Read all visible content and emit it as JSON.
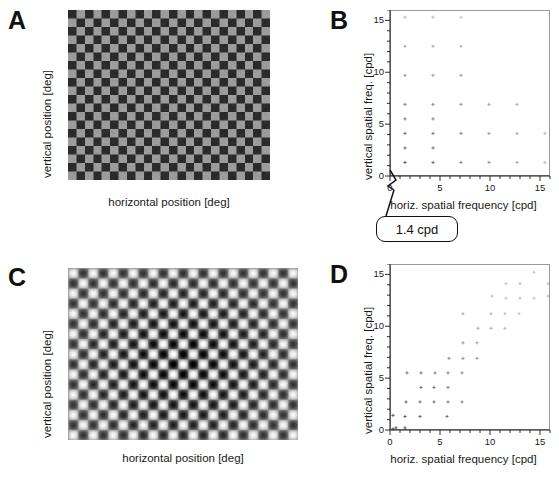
{
  "figure": {
    "panels": [
      {
        "id": "A",
        "letter": "A",
        "type": "stimulus",
        "stimulus": "checkerboard",
        "xlabel": "horizontal position [deg]",
        "ylabel": "vertical position [deg]"
      },
      {
        "id": "B",
        "letter": "B",
        "type": "scatter",
        "xlabel": "horiz. spatial frequency [cpd]",
        "ylabel": "vertical spatial freq. [cpd]"
      },
      {
        "id": "C",
        "letter": "C",
        "type": "stimulus",
        "stimulus": "blurred-checkerboard",
        "xlabel": "horizontal position [deg]",
        "ylabel": "vertical position [deg]"
      },
      {
        "id": "D",
        "letter": "D",
        "type": "scatter",
        "xlabel": "horiz. spatial frequency [cpd]",
        "ylabel": "vertical spatial freq. [cpd]"
      }
    ],
    "callout": {
      "text": "1.4 cpd"
    },
    "colors": {
      "ink": "#1a1a1a",
      "frame": "#9a9a9a",
      "point": "#555555",
      "checker_dark": "#2b2b2b",
      "checker_light": "#9a9a9a"
    }
  },
  "chart_data": [
    {
      "panel": "B",
      "type": "scatter",
      "title": "",
      "xlabel": "horiz. spatial frequency [cpd]",
      "ylabel": "vertical spatial freq. [cpd]",
      "xlim": [
        0,
        16
      ],
      "ylim": [
        0,
        16
      ],
      "xticks": [
        0,
        5,
        10,
        15
      ],
      "yticks": [
        0,
        5,
        10,
        15
      ],
      "minor_tick_step": 1,
      "grid": false,
      "legend": null,
      "annotation": "1.4 cpd",
      "annotation_target": [
        1.4,
        0
      ],
      "fundamental_cpd": 1.4,
      "description": "Regular lattice of odd-harmonic components of an ideal checkerboard; points at odd multiples of 1.4 cpd in both axes, amplitude falling off with frequency.",
      "x": [
        1.4,
        4.2,
        7.0,
        9.8,
        12.6,
        15.4,
        1.4,
        4.2,
        7.0,
        9.8,
        12.6,
        15.4,
        1.4,
        4.2,
        7.0,
        9.8,
        12.6,
        1.4,
        4.2,
        7.0,
        1.4,
        4.2,
        7.0,
        1.4,
        4.2,
        7.0,
        1.4,
        4.2,
        1.4,
        4.2
      ],
      "y": [
        1.4,
        1.4,
        1.4,
        1.4,
        1.4,
        1.4,
        4.2,
        4.2,
        4.2,
        4.2,
        4.2,
        4.2,
        7.0,
        7.0,
        7.0,
        7.0,
        7.0,
        9.8,
        9.8,
        9.8,
        12.6,
        12.6,
        12.6,
        15.4,
        15.4,
        15.4,
        2.8,
        2.8,
        5.6,
        5.6
      ]
    },
    {
      "panel": "D",
      "type": "scatter",
      "title": "",
      "xlabel": "horiz. spatial frequency [cpd]",
      "ylabel": "vertical spatial freq. [cpd]",
      "xlim": [
        0,
        16
      ],
      "ylim": [
        0,
        16
      ],
      "xticks": [
        0,
        5,
        10,
        15
      ],
      "yticks": [
        0,
        5,
        10,
        15
      ],
      "minor_tick_step": 1,
      "grid": false,
      "legend": null,
      "annotation": null,
      "description": "Spatial-frequency components of the smoothed / distorted checkerboard; energy spreads into a diagonal band rather than a clean lattice.",
      "x": [
        0.2,
        0.2,
        0.5,
        1.4,
        1.4,
        1.5,
        1.6,
        2.9,
        2.9,
        3.0,
        3.0,
        4.3,
        4.3,
        4.4,
        5.6,
        5.7,
        5.7,
        5.7,
        5.8,
        7.1,
        7.1,
        7.2,
        7.2,
        7.2,
        8.6,
        8.6,
        8.7,
        10.0,
        10.0,
        10.1,
        11.4,
        11.4,
        11.5,
        11.5,
        12.8,
        12.9,
        12.9,
        14.3,
        14.3,
        15.7,
        15.7
      ],
      "y": [
        0.2,
        1.5,
        0.3,
        0.3,
        1.4,
        2.8,
        5.6,
        1.4,
        2.8,
        4.2,
        5.6,
        2.8,
        4.2,
        5.6,
        1.4,
        2.8,
        4.2,
        5.6,
        7.0,
        2.8,
        5.6,
        7.0,
        8.5,
        11.3,
        7.0,
        8.5,
        9.9,
        9.9,
        11.3,
        13.0,
        9.9,
        11.3,
        12.8,
        14.2,
        11.3,
        12.8,
        14.2,
        12.8,
        15.3,
        13.0,
        14.2
      ]
    }
  ]
}
